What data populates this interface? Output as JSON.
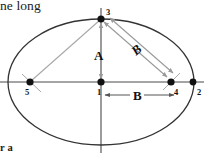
{
  "figure": {
    "title_fragment_top": "ne long",
    "title_fragment_bottom": "r a",
    "colors": {
      "ellipse_stroke": "#333333",
      "axis_stroke": "#4a4a4a",
      "arrow_gray": "#9a9a9a",
      "point_fill": "#111111",
      "label_text": "#111111"
    },
    "ellipse": {
      "center_x": 101,
      "center_y": 82,
      "radius_x": 93,
      "radius_y": 63
    },
    "axes": {
      "horizontal": {
        "x1": 0,
        "y1": 82,
        "x2": 204,
        "y2": 82
      },
      "vertical": {
        "x1": 101,
        "y1": 8,
        "x2": 101,
        "y2": 153
      }
    },
    "points": [
      {
        "id": "p1",
        "label": "1",
        "x": 101,
        "y": 82,
        "label_x": 98,
        "label_y": 93,
        "role": "center"
      },
      {
        "id": "p2",
        "label": "2",
        "x": 193,
        "y": 82,
        "label_x": 197,
        "label_y": 93,
        "role": "vertex-right"
      },
      {
        "id": "p3",
        "label": "3",
        "x": 101,
        "y": 19,
        "label_x": 106,
        "label_y": 13,
        "role": "co-vertex-top"
      },
      {
        "id": "p4",
        "label": "4",
        "x": 171,
        "y": 82,
        "label_x": 175,
        "label_y": 93,
        "role": "focus-right"
      },
      {
        "id": "p5",
        "label": "5",
        "x": 30,
        "y": 82,
        "label_x": 26,
        "label_y": 93,
        "role": "focus-left"
      }
    ],
    "measures": [
      {
        "id": "measure-A",
        "label": "A",
        "label_x": 94,
        "label_y": 57,
        "italic": false,
        "from": {
          "x": 101,
          "y": 23
        },
        "to": {
          "x": 101,
          "y": 79
        },
        "orientation": "vertical",
        "meaning": "semi-minor-axis"
      },
      {
        "id": "measure-B-diagonal",
        "label": "B",
        "label_x": 138,
        "label_y": 53,
        "italic": true,
        "rotation_deg": -41,
        "from": {
          "x": 105,
          "y": 23
        },
        "to": {
          "x": 168,
          "y": 78
        },
        "orientation": "diagonal",
        "meaning": "focus-to-co-vertex"
      },
      {
        "id": "measure-B-horizontal",
        "label": "B",
        "label_x": 138,
        "label_y": 97,
        "italic": false,
        "from": {
          "x": 105,
          "y": 95
        },
        "to": {
          "x": 174,
          "y": 95
        },
        "orientation": "horizontal",
        "meaning": "center-to-focus"
      }
    ],
    "guides": [
      {
        "id": "guide-5-to-3",
        "from": {
          "x": 31,
          "y": 81
        },
        "to": {
          "x": 100,
          "y": 20
        },
        "meaning": "left-focus-to-top"
      },
      {
        "id": "guide-5-tick",
        "from": {
          "x": 22,
          "y": 74
        },
        "to": {
          "x": 41,
          "y": 92
        },
        "meaning": "left-focus-cross-tick"
      },
      {
        "id": "guide-4-tick",
        "from": {
          "x": 163,
          "y": 90
        },
        "to": {
          "x": 180,
          "y": 73
        },
        "meaning": "right-focus-cross-tick"
      }
    ]
  }
}
